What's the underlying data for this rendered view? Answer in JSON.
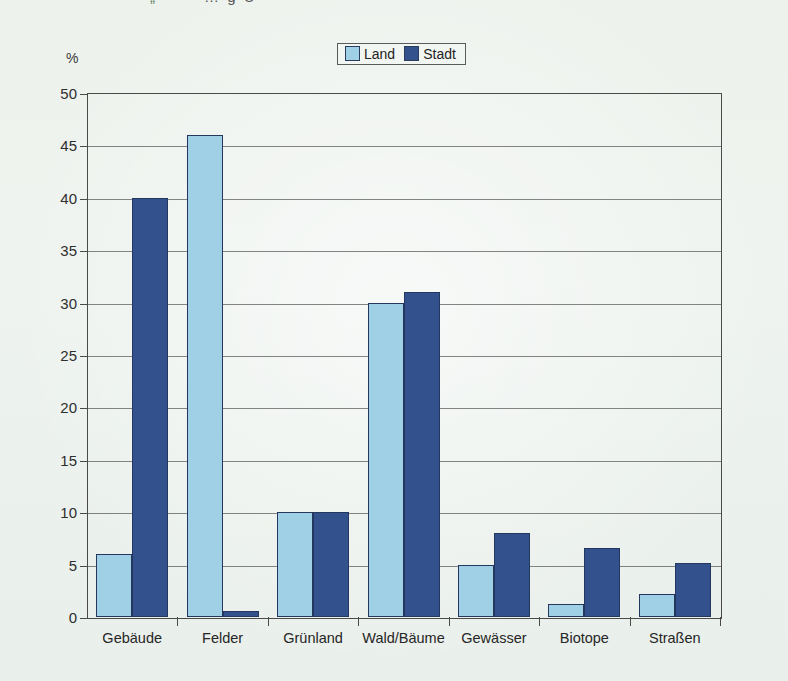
{
  "page": {
    "title_fragment_green": "„“",
    "title_fragment_dark": "… g  Ü"
  },
  "legend": {
    "items": [
      {
        "label": "Land",
        "color": "#9fd0e6"
      },
      {
        "label": "Stadt",
        "color": "#33518c"
      }
    ]
  },
  "axes": {
    "y_unit": "%",
    "y_ticks": [
      "0",
      "5",
      "10",
      "15",
      "20",
      "25",
      "30",
      "35",
      "40",
      "45",
      "50"
    ]
  },
  "chart_data": {
    "type": "bar",
    "title": "",
    "subtitle": "",
    "xlabel": "",
    "ylabel": "%",
    "ylim": [
      0,
      50
    ],
    "ytick_step": 5,
    "grid": true,
    "legend_position": "top-center",
    "categories": [
      "Gebäude",
      "Felder",
      "Grünland",
      "Wald/Bäume",
      "Gewässer",
      "Biotope",
      "Straßen"
    ],
    "series": [
      {
        "name": "Land",
        "color": "#9fd0e6",
        "values": [
          6,
          46,
          10,
          30,
          5,
          1.2,
          2.2
        ]
      },
      {
        "name": "Stadt",
        "color": "#33518c",
        "values": [
          40,
          0.6,
          10,
          31,
          8,
          6.6,
          5.2
        ]
      }
    ]
  }
}
